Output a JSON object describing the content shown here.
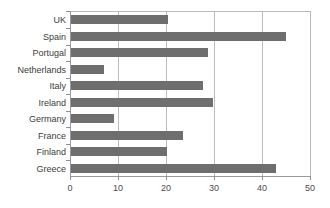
{
  "chart_data": {
    "type": "bar",
    "orientation": "horizontal",
    "title": "",
    "subtitle": "",
    "xlabel": "",
    "ylabel": "",
    "xlim": [
      0,
      50
    ],
    "ylim": null,
    "grid": true,
    "legend": false,
    "legend_position": "none",
    "xticks": [
      "0",
      "10",
      "20",
      "30",
      "40",
      "50"
    ],
    "xtick_values": [
      0,
      10,
      20,
      30,
      40,
      50
    ],
    "categories": [
      "UK",
      "Spain",
      "Portugal",
      "Netherlands",
      "Italy",
      "Ireland",
      "Germany",
      "France",
      "Finland",
      "Greece"
    ],
    "values": [
      20.3,
      44.8,
      28.5,
      6.9,
      27.5,
      29.6,
      9.0,
      23.3,
      20.0,
      42.8
    ],
    "series": [
      {
        "name": "",
        "values": [
          20.3,
          44.8,
          28.5,
          6.9,
          27.5,
          29.6,
          9.0,
          23.3,
          20.0,
          42.8
        ]
      }
    ],
    "colors": {
      "bar": "#6e6e6e",
      "gridline": "#bdbdbd",
      "axis": "#9a9a9a",
      "label_text": "#3c3c3c",
      "background": "#ffffff"
    }
  }
}
